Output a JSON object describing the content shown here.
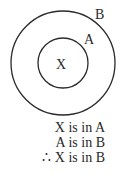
{
  "diagram": {
    "type": "nested-sets (Euler diagram)",
    "outer_set": {
      "label": "B"
    },
    "inner_set": {
      "label": "A"
    },
    "element": {
      "label": "X"
    }
  },
  "reasoning": {
    "premise_1": "X is in A",
    "premise_2": "A is in B",
    "conclusion": "∴ X is in B"
  },
  "colors": {
    "stroke": "#2a2a2a",
    "background": "#ffffff"
  }
}
